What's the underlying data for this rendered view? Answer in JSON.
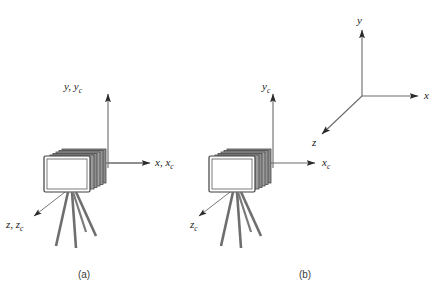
{
  "figure": {
    "background_color": "#ffffff",
    "line_color": "#4a4a4a",
    "label_color": "#1a1a1a",
    "camera_body_color": "#808080",
    "camera_face_color": "#ffffff",
    "tripod_color": "#6e6e6e"
  },
  "panels": [
    {
      "id": "panel-a",
      "caption": "(a)",
      "description": "Camera with world and camera coordinate frames coincident",
      "frames": [
        {
          "name": "combined-frame",
          "origin": {
            "x": 108,
            "y": 163
          },
          "axes": [
            {
              "name": "y-axis",
              "label_y": "y",
              "label_yc": "y",
              "label_sub": "c",
              "label_text": "y, y",
              "direction": "up"
            },
            {
              "name": "x-axis",
              "label_text": "x, x",
              "label_sub": "c",
              "direction": "right"
            },
            {
              "name": "z-axis",
              "label_text": "z, z",
              "label_sub": "c",
              "direction": "down-left"
            }
          ]
        }
      ]
    },
    {
      "id": "panel-b",
      "caption": "(b)",
      "description": "Camera frame separate from world coordinate frame",
      "frames": [
        {
          "name": "camera-frame",
          "origin": {
            "x": 273,
            "y": 163
          },
          "axes": [
            {
              "name": "yc-axis",
              "label_text": "y",
              "label_sub": "c",
              "direction": "up"
            },
            {
              "name": "xc-axis",
              "label_text": "x",
              "label_sub": "c",
              "direction": "right"
            },
            {
              "name": "zc-axis",
              "label_text": "z",
              "label_sub": "c",
              "direction": "down-left"
            }
          ]
        },
        {
          "name": "world-frame",
          "origin": {
            "x": 362,
            "y": 96
          },
          "axes": [
            {
              "name": "y-axis",
              "label_text": "y",
              "label_sub": "",
              "direction": "up"
            },
            {
              "name": "x-axis",
              "label_text": "x",
              "label_sub": "",
              "direction": "right"
            },
            {
              "name": "z-axis",
              "label_text": "z",
              "label_sub": "",
              "direction": "down-left"
            }
          ]
        }
      ]
    }
  ],
  "labels": {
    "panel_a_y": "y, y",
    "panel_a_y_sub": "c",
    "panel_a_x": "x, x",
    "panel_a_x_sub": "c",
    "panel_a_z": "z, z",
    "panel_a_z_sub": "c",
    "panel_b_yc": "y",
    "panel_b_yc_sub": "c",
    "panel_b_xc": "x",
    "panel_b_xc_sub": "c",
    "panel_b_zc": "z",
    "panel_b_zc_sub": "c",
    "world_y": "y",
    "world_x": "x",
    "world_z": "z",
    "caption_a": "(a)",
    "caption_b": "(b)"
  }
}
